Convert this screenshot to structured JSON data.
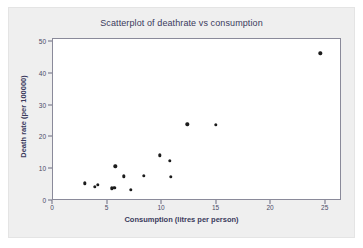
{
  "chart_data": {
    "type": "scatter",
    "title": "Scatterplot of deathrate vs consumption",
    "xlabel": "Consumption (litres per person)",
    "ylabel": "Death rate (per 100000)",
    "xlim": [
      0,
      26.5
    ],
    "ylim": [
      0,
      51
    ],
    "grid": false,
    "legend": null,
    "xticks": [
      0,
      5,
      10,
      15,
      20,
      25
    ],
    "yticks": [
      0,
      10,
      20,
      30,
      40,
      50
    ],
    "xtick_labels": [
      "0",
      "5",
      "10",
      "15",
      "20",
      "25"
    ],
    "ytick_labels": [
      "0",
      "10",
      "20",
      "30",
      "40",
      "50"
    ],
    "marker": "filled-circle",
    "marker_color": "#1c1c1c",
    "series": [
      {
        "name": "deathrate vs consumption",
        "points": [
          {
            "x": 3.0,
            "y": 5.3
          },
          {
            "x": 3.9,
            "y": 4.1
          },
          {
            "x": 4.2,
            "y": 4.7
          },
          {
            "x": 5.5,
            "y": 3.7
          },
          {
            "x": 5.7,
            "y": 3.8
          },
          {
            "x": 5.8,
            "y": 10.6
          },
          {
            "x": 6.6,
            "y": 7.4
          },
          {
            "x": 7.2,
            "y": 3.2
          },
          {
            "x": 8.4,
            "y": 7.6
          },
          {
            "x": 9.9,
            "y": 14.1
          },
          {
            "x": 10.8,
            "y": 12.3
          },
          {
            "x": 10.9,
            "y": 7.3
          },
          {
            "x": 12.4,
            "y": 23.8
          },
          {
            "x": 15.0,
            "y": 23.6
          },
          {
            "x": 24.6,
            "y": 46.2
          }
        ]
      }
    ]
  },
  "figure": {
    "background_color": "#efefef",
    "plot_background_color": "#ffffff",
    "axis_color": "#8a8a9a",
    "text_color": "#3a3a5c"
  }
}
